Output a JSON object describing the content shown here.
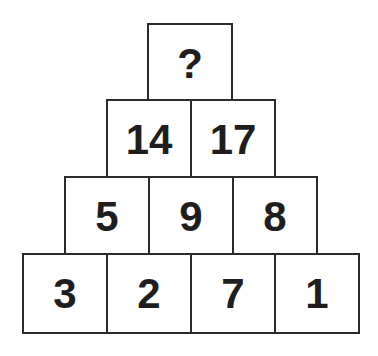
{
  "puzzle": {
    "type": "number-pyramid",
    "rows": [
      {
        "cells": [
          "?"
        ]
      },
      {
        "cells": [
          "14",
          "17"
        ]
      },
      {
        "cells": [
          "5",
          "9",
          "8"
        ]
      },
      {
        "cells": [
          "3",
          "2",
          "7",
          "1"
        ]
      }
    ]
  },
  "colors": {
    "border": "#2b2b2b",
    "text": "#1e1e1e",
    "background": "#ffffff"
  }
}
